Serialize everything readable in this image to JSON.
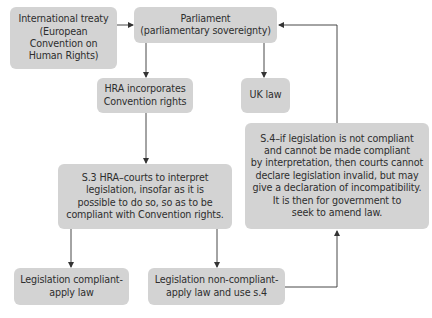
{
  "diagram": {
    "type": "flowchart",
    "colors": {
      "node_fill": "#d3d3d3",
      "node_text": "#2e2e2e",
      "connector": "#333333"
    },
    "nodes": {
      "treaty": {
        "label": "International treaty\n(European\nConvention on\nHuman Rights)"
      },
      "parliament": {
        "label": "Parliament\n(parliamentary sovereignty)"
      },
      "hra": {
        "label": "HRA incorporates\nConvention rights"
      },
      "uk_law": {
        "label": "UK law"
      },
      "s3": {
        "label": "S.3 HRA–courts to interpret\nlegislation, insofar as it is\npossible to do so, so as to be\ncompliant with Convention rights."
      },
      "s4": {
        "label": "S.4–if legislation is not compliant\nand cannot be made compliant\nby interpretation, then courts cannot\ndeclare legislation invalid, but may\ngive a declaration of incompatibility.\nIt is then for government to\nseek to amend law."
      },
      "compliant": {
        "label": "Legislation compliant-\napply law"
      },
      "non_compliant": {
        "label": "Legislation non-compliant-\napply law and use s.4"
      }
    },
    "edges": [
      {
        "from": "treaty",
        "to": "parliament"
      },
      {
        "from": "parliament",
        "to": "hra"
      },
      {
        "from": "parliament",
        "to": "uk_law"
      },
      {
        "from": "hra",
        "to": "s3"
      },
      {
        "from": "s3",
        "to": "compliant"
      },
      {
        "from": "s3",
        "to": "non_compliant"
      },
      {
        "from": "non_compliant",
        "to": "s4"
      },
      {
        "from": "s4",
        "to": "parliament"
      }
    ]
  }
}
